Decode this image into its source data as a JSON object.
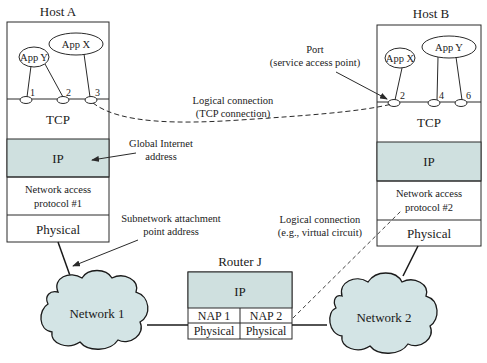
{
  "colors": {
    "shade": "#cfe0df",
    "cloud": "#d3e4e5",
    "stroke": "#2a2a2a"
  },
  "host_a": {
    "title": "Host A",
    "apps": [
      {
        "label": "App Y"
      },
      {
        "label": "App X"
      }
    ],
    "ports": [
      "1",
      "2",
      "3"
    ],
    "layers": {
      "tcp": "TCP",
      "ip": "IP",
      "nap_line1": "Network access",
      "nap_line2": "protocol #1",
      "physical": "Physical"
    }
  },
  "host_b": {
    "title": "Host B",
    "apps": [
      {
        "label": "App X"
      },
      {
        "label": "App Y"
      }
    ],
    "ports": [
      "2",
      "4",
      "6"
    ],
    "layers": {
      "tcp": "TCP",
      "ip": "IP",
      "nap_line1": "Network access",
      "nap_line2": "protocol #2",
      "physical": "Physical"
    }
  },
  "router": {
    "title": "Router J",
    "ip": "IP",
    "nap1": "NAP 1",
    "nap2": "NAP 2",
    "physical1": "Physical",
    "physical2": "Physical"
  },
  "networks": {
    "net1": "Network 1",
    "net2": "Network 2"
  },
  "annotations": {
    "port_line1": "Port",
    "port_line2": "(service access point)",
    "tcp_conn_line1": "Logical connection",
    "tcp_conn_line2": "(TCP connection)",
    "global_line1": "Global Internet",
    "global_line2": "address",
    "subnet_line1": "Subnetwork attachment",
    "subnet_line2": "point address",
    "vc_line1": "Logical connection",
    "vc_line2": "(e.g., virtual circuit)"
  }
}
